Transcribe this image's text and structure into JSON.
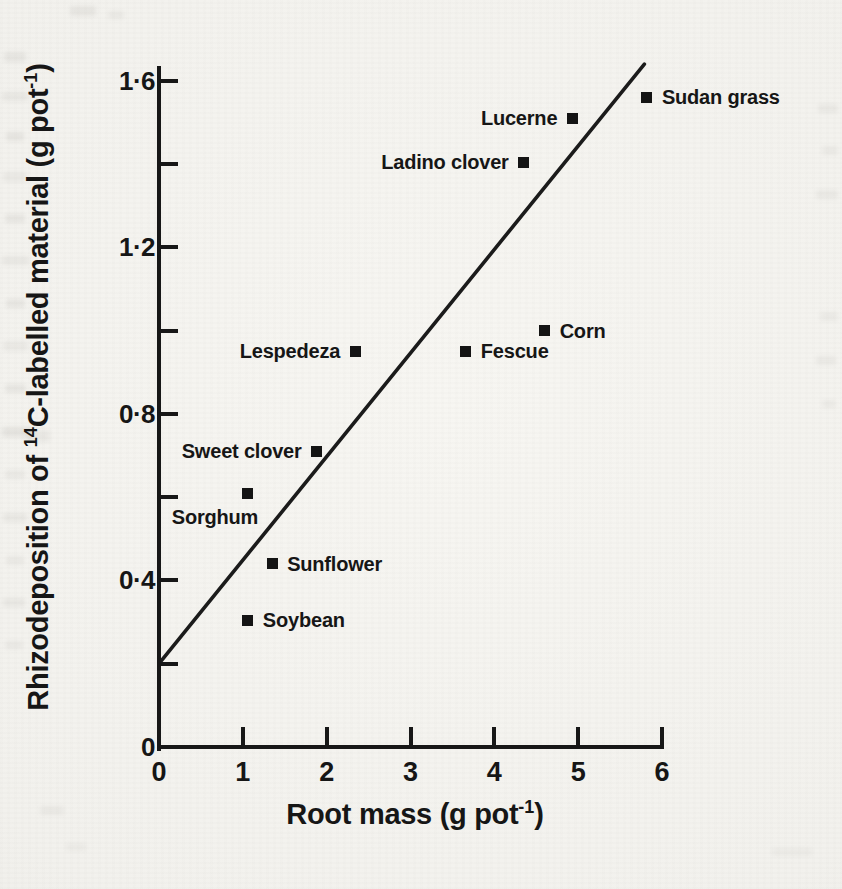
{
  "figure": {
    "paper_color": "#f2f1ed",
    "ink_color": "#171717"
  },
  "chart_data": {
    "type": "scatter",
    "title": "",
    "xlabel": "Root mass (g pot⁻¹)",
    "ylabel": "Rhizodeposition of ¹⁴C-labelled material (g pot⁻¹)",
    "xlabel_parts": [
      {
        "t": "Root mass (g pot"
      },
      {
        "t": "-1",
        "sup": true
      },
      {
        "t": ")"
      }
    ],
    "ylabel_parts": [
      {
        "t": "Rhizodeposition of "
      },
      {
        "t": "14",
        "sup": true
      },
      {
        "t": "C-labelled material (g pot"
      },
      {
        "t": "-1",
        "sup": true
      },
      {
        "t": ")"
      }
    ],
    "xlim": [
      0,
      6
    ],
    "ylim": [
      0,
      1.65
    ],
    "grid": false,
    "legend": false,
    "x_ticks": [
      {
        "value": 0,
        "label": "0"
      },
      {
        "value": 1,
        "label": "1"
      },
      {
        "value": 2,
        "label": "2"
      },
      {
        "value": 3,
        "label": "3"
      },
      {
        "value": 4,
        "label": "4"
      },
      {
        "value": 5,
        "label": "5"
      },
      {
        "value": 6,
        "label": "6"
      }
    ],
    "y_major_ticks": [
      {
        "value": 1.6,
        "label": "1·6"
      },
      {
        "value": 1.2,
        "label": "1·2"
      },
      {
        "value": 0.8,
        "label": "0·8"
      },
      {
        "value": 0.4,
        "label": "0·4"
      },
      {
        "value": 0,
        "label": "0"
      }
    ],
    "y_minor_ticks": [
      0.2,
      0.6,
      1.0,
      1.4
    ],
    "points": [
      {
        "name": "Sudan grass",
        "x": 5.82,
        "y": 1.56,
        "label_side": "right"
      },
      {
        "name": "Lucerne",
        "x": 4.93,
        "y": 1.51,
        "label_side": "left"
      },
      {
        "name": "Ladino clover",
        "x": 4.35,
        "y": 1.405,
        "label_side": "left"
      },
      {
        "name": "Corn",
        "x": 4.6,
        "y": 1.0,
        "label_side": "right"
      },
      {
        "name": "Fescue",
        "x": 3.66,
        "y": 0.95,
        "label_side": "right"
      },
      {
        "name": "Lespedeza",
        "x": 2.34,
        "y": 0.95,
        "label_side": "left"
      },
      {
        "name": "Sweet clover",
        "x": 1.88,
        "y": 0.71,
        "label_side": "left"
      },
      {
        "name": "Sorghum",
        "x": 1.05,
        "y": 0.61,
        "label_side": "below",
        "dx": -32,
        "dy": 11
      },
      {
        "name": "Sunflower",
        "x": 1.35,
        "y": 0.44,
        "label_side": "right"
      },
      {
        "name": "Soybean",
        "x": 1.06,
        "y": 0.305,
        "label_side": "right"
      }
    ],
    "regression_line": {
      "x1": 0,
      "y1": 0.2,
      "x2": 5.79,
      "y2": 1.64
    }
  }
}
